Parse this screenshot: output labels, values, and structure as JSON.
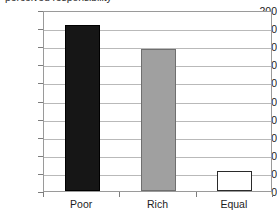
{
  "chart_data": {
    "type": "bar",
    "title": "perceived responsibility",
    "title_clipped": true,
    "categories": [
      "Poor",
      "Rich",
      "Equal"
    ],
    "values": [
      183,
      157,
      22
    ],
    "series": [
      {
        "name": "perceived responsibility",
        "values": [
          183,
          157,
          22
        ]
      }
    ],
    "bar_colors": [
      "#161616",
      "#a0a0a0",
      "#ffffff"
    ],
    "bar_edge_colors": [
      "#000000",
      "#6f6f6f",
      "#2a2a2a"
    ],
    "xlabel": "",
    "ylabel": "",
    "ylim": [
      0,
      200
    ],
    "ytick_labels": [
      "200",
      "180",
      "160",
      "140",
      "120",
      "100",
      "80",
      "60",
      "40",
      "20",
      "0"
    ],
    "ytick_values": [
      200,
      180,
      160,
      140,
      120,
      100,
      80,
      60,
      40,
      20,
      0
    ],
    "grid": true,
    "grid_axis": "y",
    "grid_color": "#b9b9b9",
    "legend": null,
    "legend_position": "none",
    "plot_background": "#ffffff",
    "frame_color": "#9a9a9a"
  }
}
